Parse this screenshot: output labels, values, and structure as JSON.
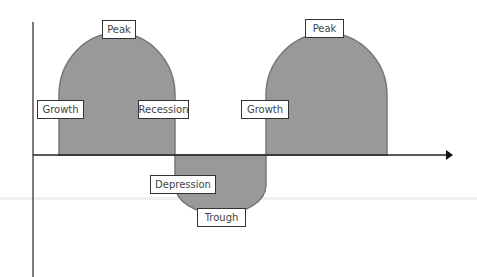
{
  "diagram": {
    "colors": {
      "fill": "#999999",
      "stroke": "#777777",
      "axis": "#222222",
      "label_border": "#333333",
      "label_text": "#444444"
    },
    "labels": [
      {
        "id": "peak-1",
        "text": "Peak"
      },
      {
        "id": "growth-1",
        "text": "Growth"
      },
      {
        "id": "recession",
        "text": "Recession"
      },
      {
        "id": "growth-2",
        "text": "Growth"
      },
      {
        "id": "peak-2",
        "text": "Peak"
      },
      {
        "id": "depression",
        "text": "Depression"
      },
      {
        "id": "trough",
        "text": "Trough"
      }
    ],
    "phases_sequence": [
      "Growth",
      "Peak",
      "Recession",
      "Depression",
      "Trough",
      "Growth",
      "Peak"
    ]
  }
}
